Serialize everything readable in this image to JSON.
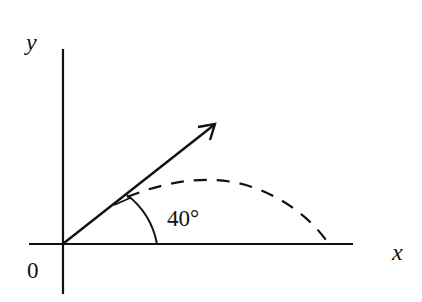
{
  "diagram": {
    "type": "projectile-launch",
    "axes": {
      "x_label": "x",
      "y_label": "y",
      "origin_label": "0"
    },
    "launch_angle_label": "40°",
    "launch_angle_degrees": 40,
    "elements": {
      "velocity_vector": "solid arrow from origin at 40° above x-axis",
      "trajectory": "dashed parabolic arc from origin landing further along x-axis",
      "angle_arc": "arc between x-axis and velocity vector marking 40°"
    },
    "colors": {
      "stroke": "#111111",
      "background": "#ffffff"
    }
  }
}
